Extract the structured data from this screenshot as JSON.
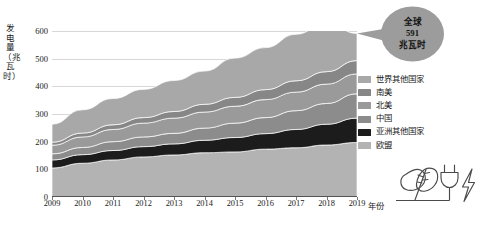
{
  "chart_data": {
    "type": "area",
    "title": "",
    "subtitle": "",
    "xlabel": "年份",
    "ylabel": "发电量（兆瓦时）",
    "stacked": true,
    "grid": true,
    "legend_position": "right",
    "xlim": [
      2009,
      2019
    ],
    "ylim": [
      0,
      600
    ],
    "yticks": [
      0,
      100,
      200,
      300,
      400,
      500,
      600
    ],
    "categories": [
      "2009",
      "2010",
      "2011",
      "2012",
      "2013",
      "2014",
      "2015",
      "2016",
      "2017",
      "2018",
      "2019"
    ],
    "x": [
      2009,
      2010,
      2011,
      2012,
      2013,
      2014,
      2015,
      2016,
      2017,
      2018,
      2019
    ],
    "series": [
      {
        "name": "欧盟",
        "color": "#b3b3b3",
        "values": [
          105,
          122,
          134,
          145,
          152,
          160,
          163,
          173,
          178,
          188,
          197
        ]
      },
      {
        "name": "亚洲其他国家",
        "color": "#1c1c1c",
        "values": [
          29,
          31,
          34,
          37,
          40,
          45,
          52,
          56,
          66,
          75,
          88
        ]
      },
      {
        "name": "中国",
        "color": "#8c8c8c",
        "values": [
          22,
          26,
          32,
          35,
          38,
          44,
          52,
          58,
          68,
          75,
          88
        ]
      },
      {
        "name": "北美",
        "color": "#9a9a9a",
        "values": [
          31,
          38,
          44,
          50,
          55,
          58,
          61,
          65,
          67,
          70,
          72
        ]
      },
      {
        "name": "南美",
        "color": "#878787",
        "values": [
          11,
          14,
          17,
          20,
          24,
          28,
          32,
          36,
          41,
          45,
          48
        ]
      },
      {
        "name": "世界其他国家",
        "color": "#a8a8a8",
        "values": [
          65,
          84,
          95,
          102,
          112,
          120,
          142,
          152,
          168,
          178,
          98
        ]
      }
    ],
    "totals": [
      263,
      315,
      356,
      389,
      421,
      455,
      502,
      540,
      588,
      631,
      591
    ]
  },
  "yaxis": {
    "title": "发电量（兆瓦时）",
    "ticks": [
      "600",
      "500",
      "400",
      "300",
      "200",
      "100",
      "0"
    ]
  },
  "xaxis": {
    "title": "年份",
    "ticks": [
      "2009",
      "2010",
      "2011",
      "2012",
      "2013",
      "2014",
      "2015",
      "2016",
      "2017",
      "2018",
      "2019"
    ]
  },
  "legend": {
    "items": [
      {
        "label": "世界其他国家",
        "color": "#a8a8a8"
      },
      {
        "label": "南美",
        "color": "#878787"
      },
      {
        "label": "北美",
        "color": "#9a9a9a"
      },
      {
        "label": "中国",
        "color": "#8c8c8c"
      },
      {
        "label": "亚洲其他国家",
        "color": "#1c1c1c"
      },
      {
        "label": "欧盟",
        "color": "#b3b3b3"
      }
    ]
  },
  "callout": {
    "line1": "全球",
    "line2": "591",
    "line3": "兆瓦时",
    "color": "#9c9c9c"
  },
  "icons": {
    "leaf": "leaf-icon",
    "plug": "power-plug-icon",
    "bolt": "lightning-bolt-icon"
  }
}
